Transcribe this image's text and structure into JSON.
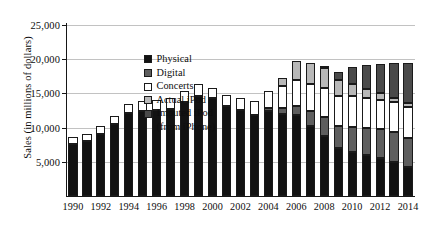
{
  "chart_data": {
    "type": "bar",
    "subtype": "stacked-bar",
    "title": "",
    "xlabel": "",
    "ylabel": "Sales (in millions of dollars)",
    "ylim": [
      0,
      25000
    ],
    "ytick_values": [
      5000,
      10000,
      15000,
      20000,
      25000
    ],
    "ytick_labels": [
      "5,000",
      "10,000",
      "15,000",
      "20,000",
      "25,000"
    ],
    "grid": true,
    "legend_position": "upper-left-inside",
    "categories": [
      "1990",
      "1991",
      "1992",
      "1993",
      "1994",
      "1995",
      "1996",
      "1997",
      "1998",
      "1999",
      "2000",
      "2001",
      "2002",
      "2003",
      "2004",
      "2005",
      "2006",
      "2007",
      "2008",
      "2009",
      "2010",
      "2011",
      "2012",
      "2013",
      "2014"
    ],
    "xtick_labels": [
      "1990",
      "1992",
      "1994",
      "1996",
      "1998",
      "2000",
      "2002",
      "2004",
      "2006",
      "2008",
      "2010",
      "2012",
      "2014"
    ],
    "series": [
      {
        "name": "Physical",
        "color": "#121212",
        "values": [
          7600,
          8000,
          9100,
          10500,
          12100,
          12500,
          12600,
          12700,
          13700,
          14600,
          14300,
          13200,
          12600,
          11900,
          12400,
          12000,
          11800,
          10300,
          8800,
          7000,
          6400,
          6000,
          5600,
          5000,
          4200
        ]
      },
      {
        "name": "Digital",
        "color": "#5e5e5e",
        "values": [
          0,
          0,
          0,
          0,
          0,
          0,
          0,
          0,
          0,
          0,
          0,
          0,
          0,
          0,
          400,
          900,
          1400,
          2100,
          2800,
          3300,
          3700,
          4000,
          4200,
          4300,
          4300
        ]
      },
      {
        "name": "Concerts",
        "color": "#ffffff",
        "values": [
          1100,
          1100,
          1100,
          1200,
          1300,
          1400,
          1500,
          1600,
          1700,
          1800,
          1500,
          1600,
          1700,
          2000,
          2600,
          3200,
          3700,
          4000,
          4200,
          4300,
          4500,
          4400,
          4300,
          4400,
          4500
        ]
      },
      {
        "name": "Actual iPod",
        "color": "#b8b8b8",
        "values": [
          0,
          0,
          0,
          0,
          0,
          0,
          0,
          0,
          0,
          0,
          0,
          0,
          0,
          0,
          0,
          1100,
          2900,
          3100,
          2900,
          2400,
          1800,
          1300,
          900,
          700,
          600
        ]
      },
      {
        "name": "Imputed iPod (from iPhone)",
        "color": "#4a4a4a",
        "values": [
          0,
          0,
          0,
          0,
          0,
          0,
          0,
          0,
          0,
          0,
          0,
          0,
          0,
          0,
          0,
          0,
          0,
          0,
          300,
          1100,
          2400,
          3400,
          4300,
          5000,
          5800
        ]
      }
    ]
  },
  "legend": {
    "items": [
      {
        "label": "Physical",
        "color": "#121212"
      },
      {
        "label": "Digital",
        "color": "#5e5e5e"
      },
      {
        "label": "Concerts",
        "color": "#ffffff"
      },
      {
        "label": "Actual iPod",
        "color": "#b8b8b8"
      },
      {
        "label": "Imputed iPod",
        "color": "#4a4a4a"
      }
    ],
    "sub_label": "(from iPhone)"
  }
}
